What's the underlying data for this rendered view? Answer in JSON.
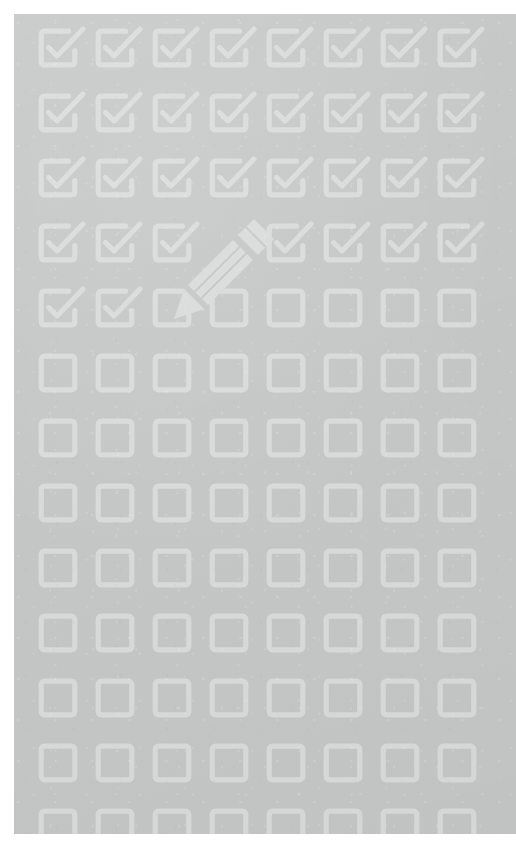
{
  "scene": {
    "title": "Checklist completion illustration",
    "description": "A flat illustration of a grid of checkbox icons on a gray card. The first rows are ticked and a pencil is in the act of ticking the next one; the remaining boxes are still empty.",
    "background_color": "#ffffff",
    "panel_color": "#c5c6c6",
    "icon_color": "#d9dada"
  },
  "panel": {
    "x": 14,
    "y": 14,
    "width": 502,
    "height": 820
  },
  "grid": {
    "columns": 8,
    "rows": 13,
    "column_spacing": 57,
    "row_spacing": 65,
    "origin_x": 24,
    "origin_y": 14,
    "cell_size": 40,
    "checked_count": 35,
    "unchecked_count": 68,
    "in_progress_count": 1,
    "states": [
      [
        "checked",
        "checked",
        "checked",
        "checked",
        "checked",
        "checked",
        "checked",
        "checked"
      ],
      [
        "checked",
        "checked",
        "checked",
        "checked",
        "checked",
        "checked",
        "checked",
        "checked"
      ],
      [
        "checked",
        "checked",
        "checked",
        "checked",
        "checked",
        "checked",
        "checked",
        "checked"
      ],
      [
        "checked",
        "checked",
        "checked",
        "hidden",
        "checked",
        "checked",
        "checked",
        "checked"
      ],
      [
        "checked",
        "checked",
        "in-progress",
        "empty",
        "empty",
        "empty",
        "empty",
        "empty"
      ],
      [
        "empty",
        "empty",
        "empty",
        "empty",
        "empty",
        "empty",
        "empty",
        "empty"
      ],
      [
        "empty",
        "empty",
        "empty",
        "empty",
        "empty",
        "empty",
        "empty",
        "empty"
      ],
      [
        "empty",
        "empty",
        "empty",
        "empty",
        "empty",
        "empty",
        "empty",
        "empty"
      ],
      [
        "empty",
        "empty",
        "empty",
        "empty",
        "empty",
        "empty",
        "empty",
        "empty"
      ],
      [
        "empty",
        "empty",
        "empty",
        "empty",
        "empty",
        "empty",
        "empty",
        "empty"
      ],
      [
        "empty",
        "empty",
        "empty",
        "empty",
        "empty",
        "empty",
        "empty",
        "empty"
      ],
      [
        "empty",
        "empty",
        "empty",
        "empty",
        "empty",
        "empty",
        "empty",
        "empty"
      ],
      [
        "empty",
        "empty",
        "empty",
        "empty",
        "empty",
        "empty",
        "empty",
        "empty"
      ]
    ]
  },
  "pencil": {
    "label": "pencil",
    "tip_x": 170,
    "tip_y": 290,
    "eraser_x": 255,
    "eraser_y": 205,
    "angle_degrees": -45,
    "color": "#d9dada"
  },
  "icons": {
    "checked": "checkbox-checked-icon",
    "empty": "checkbox-empty-icon",
    "in_progress": "checkbox-being-checked-icon",
    "pencil": "pencil-icon"
  }
}
